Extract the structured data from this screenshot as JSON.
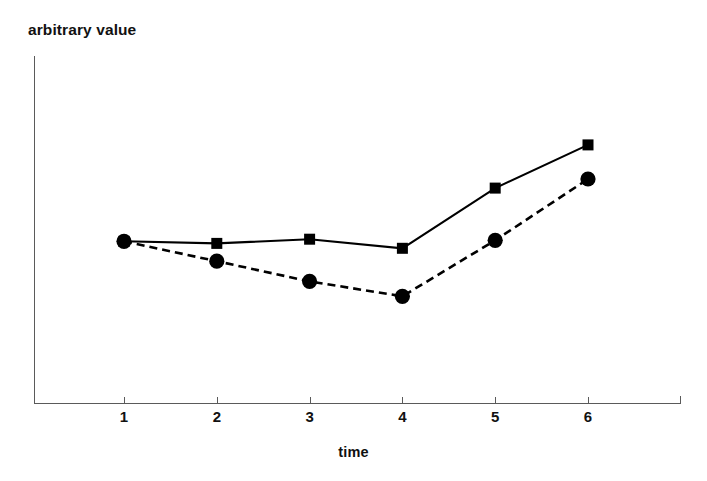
{
  "chart_data": {
    "type": "line",
    "title": "",
    "subtitle": "",
    "xlabel": "time",
    "ylabel": "arbitrary value",
    "x": [
      1,
      2,
      3,
      4,
      5,
      6
    ],
    "categories": [
      "1",
      "2",
      "3",
      "4",
      "5",
      "6"
    ],
    "xticklabels": [
      "1",
      "2",
      "3",
      "4",
      "5",
      "6"
    ],
    "yticklabels": [],
    "xlim": [
      0.5,
      6.6
    ],
    "ylim": [
      0,
      1
    ],
    "grid": false,
    "legend": false,
    "legend_position": "none",
    "annotations": [],
    "series": [
      {
        "name": "solid-series",
        "marker": "square",
        "linestyle": "solid",
        "color": "#000000",
        "values": [
          0.466,
          0.46,
          0.472,
          0.446,
          0.619,
          0.743
        ]
      },
      {
        "name": "dashed-series",
        "marker": "circle",
        "linestyle": "dashed",
        "color": "#000000",
        "values": [
          0.466,
          0.409,
          0.351,
          0.308,
          0.469,
          0.645
        ]
      }
    ]
  },
  "axes": {
    "ylabel": "arbitrary value",
    "xlabel": "time"
  }
}
